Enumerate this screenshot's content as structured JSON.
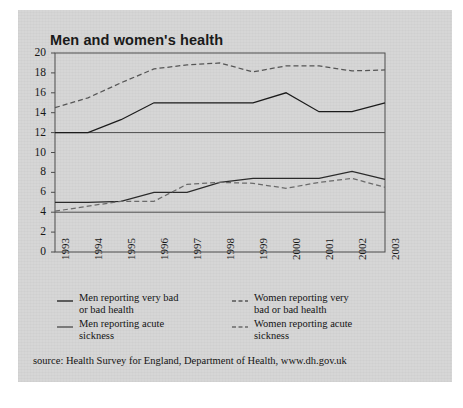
{
  "card": {
    "title": "Men and women's health",
    "bg_color": "#d6d6d6"
  },
  "source": {
    "text": "source: Health Survey for England, Department of Health, www.dh.gov.uk"
  },
  "legend": {
    "items": [
      {
        "label_line1": "Men reporting very bad",
        "label_line2": "or bad health",
        "style": "solid",
        "color": "#1b1b1b",
        "marker": "solid-line-marker"
      },
      {
        "label_line1": "Women reporting very",
        "label_line2": "bad or bad health",
        "style": "dashed",
        "color": "#555555",
        "marker": "dashed-line-marker"
      },
      {
        "label_line1": "Men reporting acute",
        "label_line2": "sickness",
        "style": "solid",
        "color": "#4a4a4a",
        "marker": "solid-line-marker"
      },
      {
        "label_line1": "Women reporting acute",
        "label_line2": "sickness",
        "style": "dashed",
        "color": "#6a6a6a",
        "marker": "dashed-line-marker"
      }
    ]
  },
  "chart_data": {
    "type": "line",
    "title": "Men and women's health",
    "xlabel": "",
    "ylabel": "",
    "ylim": [
      0,
      20
    ],
    "ytick_step": 2,
    "yticks": [
      0,
      2,
      4,
      6,
      8,
      10,
      12,
      14,
      16,
      18,
      20
    ],
    "gridlines": [
      4,
      12
    ],
    "grid": true,
    "legend_position": "below-axis",
    "categories": [
      "1993",
      "1994",
      "1995",
      "1996",
      "1997",
      "1998",
      "1999",
      "2000",
      "2001",
      "2002",
      "2003"
    ],
    "series": [
      {
        "name": "Men reporting very bad or bad health",
        "style": "solid",
        "color": "#1b1b1b",
        "values": [
          12.0,
          12.0,
          13.3,
          15.0,
          15.0,
          15.0,
          15.0,
          16.0,
          14.1,
          14.1,
          15.0
        ]
      },
      {
        "name": "Women reporting very bad or bad health",
        "style": "dashed",
        "color": "#555555",
        "values": [
          14.5,
          15.5,
          17.0,
          18.4,
          18.8,
          19.0,
          18.1,
          18.7,
          18.7,
          18.2,
          18.3
        ]
      },
      {
        "name": "Men reporting acute sickness",
        "style": "solid",
        "color": "#2b2b2b",
        "values": [
          5.0,
          5.0,
          5.1,
          6.0,
          6.0,
          7.0,
          7.4,
          7.4,
          7.4,
          8.1,
          7.3
        ]
      },
      {
        "name": "Women reporting acute sickness",
        "style": "dashed",
        "color": "#6a6a6a",
        "values": [
          4.1,
          4.6,
          5.1,
          5.1,
          6.8,
          7.0,
          6.9,
          6.4,
          7.0,
          7.4,
          6.5
        ]
      }
    ]
  }
}
